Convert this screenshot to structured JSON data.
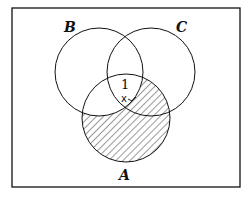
{
  "diagram": {
    "type": "venn",
    "sets": [
      {
        "label": "A",
        "cx": 126,
        "cy": 118,
        "r": 44
      },
      {
        "label": "B",
        "cx": 99,
        "cy": 72,
        "r": 44
      },
      {
        "label": "C",
        "cx": 151,
        "cy": 72,
        "r": 44
      }
    ],
    "region_labels": [
      {
        "text": "1",
        "region": "A∩B∩C"
      },
      {
        "text": "x",
        "region": "A∩C only (pointer)"
      }
    ],
    "shaded_region": "A − B",
    "colors": {
      "stroke": "#111111",
      "background": "#ffffff",
      "hatch": "#333333"
    }
  }
}
